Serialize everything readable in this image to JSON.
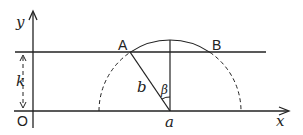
{
  "diagram": {
    "labels": {
      "y_axis": "y",
      "x_axis": "x",
      "origin": "O",
      "offset": "k",
      "point_a": "A",
      "point_b": "B",
      "segment": "b",
      "angle": "β",
      "center": "a"
    },
    "colors": {
      "stroke": "#222222",
      "background": "#ffffff"
    }
  }
}
